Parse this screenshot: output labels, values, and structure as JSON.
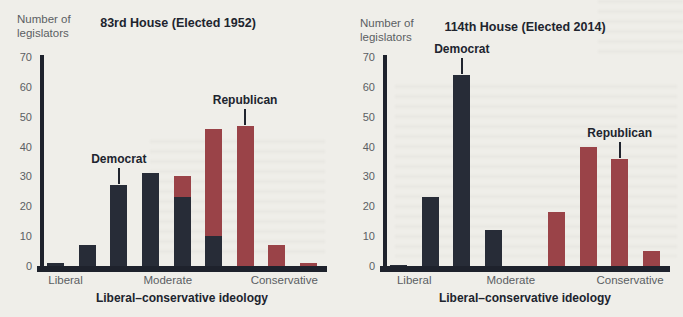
{
  "page": {
    "background": "#efeee9"
  },
  "colors": {
    "democrat": "#272c37",
    "republican": "#9a4348",
    "axis": "#1e222c",
    "tick_text": "#5b5e63",
    "title_text": "#20242e"
  },
  "chart_data": [
    {
      "type": "bar",
      "title": "83rd House (Elected 1952)",
      "ylabel_line1": "Number of",
      "ylabel_line2": "legislators",
      "xlabel": "Liberal–conservative ideology",
      "ylim": [
        0,
        70
      ],
      "yticks": [
        70,
        60,
        50,
        40,
        30,
        20,
        10,
        0
      ],
      "slots": 9,
      "grid": "off",
      "legend": "inline-annotations",
      "xticks": [
        {
          "label": "Liberal",
          "pos": 0.09
        },
        {
          "label": "Moderate",
          "pos": 0.45
        },
        {
          "label": "Conservative",
          "pos": 0.86
        }
      ],
      "series": [
        {
          "name": "Republican",
          "values": [
            null,
            null,
            null,
            null,
            30,
            46,
            47,
            7,
            1
          ]
        },
        {
          "name": "Democrat",
          "values": [
            1,
            7,
            27,
            31,
            23,
            10,
            null,
            null,
            null
          ]
        }
      ],
      "annotations": [
        {
          "text": "Democrat",
          "slot": 2,
          "value": 27
        },
        {
          "text": "Republican",
          "slot": 6,
          "value": 47
        }
      ]
    },
    {
      "type": "bar",
      "title": "114th House (Elected 2014)",
      "ylabel_line1": "Number of",
      "ylabel_line2": "legislators",
      "xlabel": "Liberal–conservative ideology",
      "ylim": [
        0,
        70
      ],
      "yticks": [
        70,
        60,
        50,
        40,
        30,
        20,
        10,
        0
      ],
      "slots": 9,
      "grid": "off",
      "legend": "inline-annotations",
      "xticks": [
        {
          "label": "Liberal",
          "pos": 0.11
        },
        {
          "label": "Moderate",
          "pos": 0.45
        },
        {
          "label": "Conservative",
          "pos": 0.87
        }
      ],
      "series": [
        {
          "name": "Republican",
          "values": [
            null,
            null,
            null,
            null,
            null,
            18,
            40,
            36,
            5
          ]
        },
        {
          "name": "Democrat",
          "values": [
            0.5,
            23,
            64,
            12,
            null,
            null,
            null,
            null,
            null
          ]
        }
      ],
      "annotations": [
        {
          "text": "Democrat",
          "slot": 2,
          "value": 64
        },
        {
          "text": "Republican",
          "slot": 7,
          "value": 36
        }
      ]
    }
  ]
}
